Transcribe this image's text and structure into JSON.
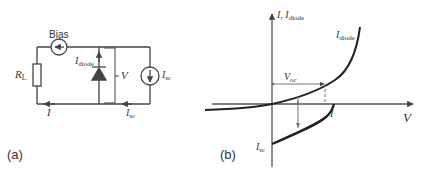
{
  "panel_a": {
    "caption": "(a)",
    "bias_label": "Bias",
    "load_label": "R",
    "load_sub": "L",
    "diode_current_label": "I",
    "diode_current_sub": "diode",
    "voltage_label": "V",
    "source_label": "I",
    "source_sub": "sc",
    "loop_current_label": "I",
    "bottom_source_label": "I",
    "bottom_source_sub": "sc"
  },
  "panel_b": {
    "caption": "(b)",
    "y_axis_label": "I, I",
    "y_axis_sub": "diode",
    "x_axis_label": "V",
    "curve_label": "I",
    "curve_sub": "diode",
    "voc_label": "V",
    "voc_sub": "oc",
    "i_label": "I",
    "isc_label": "I",
    "isc_sub": "sc"
  }
}
